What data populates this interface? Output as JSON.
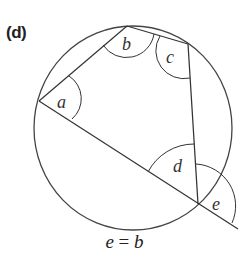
{
  "figure": {
    "label": "(d)",
    "caption": {
      "left": "e",
      "eq": " = ",
      "right": "b"
    },
    "angles": [
      {
        "name": "a",
        "x": 57,
        "y": 108
      },
      {
        "name": "b",
        "x": 122,
        "y": 50
      },
      {
        "name": "c",
        "x": 166,
        "y": 63
      },
      {
        "name": "d",
        "x": 173,
        "y": 172
      },
      {
        "name": "e",
        "x": 212,
        "y": 210
      }
    ],
    "colors": {
      "stroke": "#333333",
      "text": "#222222"
    }
  }
}
